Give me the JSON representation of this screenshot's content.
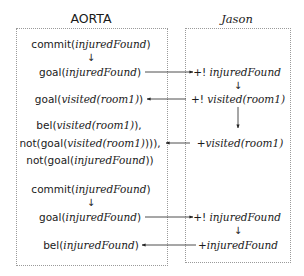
{
  "columns": {
    "left": {
      "title": "AORTA"
    },
    "right": {
      "title": "Jason"
    }
  },
  "left_items": [
    {
      "id": "l1",
      "prefix": "commit(",
      "arg": "injuredFound",
      "suffix": ")"
    },
    {
      "id": "l2",
      "prefix": "goal(",
      "arg": "injuredFound",
      "suffix": ")"
    },
    {
      "id": "l3",
      "prefix": "goal(",
      "arg": "visited(room1)",
      "suffix": ")"
    },
    {
      "id": "l4a",
      "prefix": "bel(",
      "arg": "visited(room1)",
      "suffix": "),",
      "continuation": true
    },
    {
      "id": "l4b",
      "prefix": "not(goal(",
      "arg": "visited(room1)",
      "suffix": "))),",
      "continuation": true
    },
    {
      "id": "l4c",
      "prefix": "not(goal(",
      "arg": "injuredFound",
      "suffix": "))"
    },
    {
      "id": "l5",
      "prefix": "commit(",
      "arg": "injuredFound",
      "suffix": ")"
    },
    {
      "id": "l6",
      "prefix": "goal(",
      "arg": "injuredFound",
      "suffix": ")"
    },
    {
      "id": "l7",
      "prefix": "bel(",
      "arg": "injuredFound",
      "suffix": ")"
    }
  ],
  "right_items": [
    {
      "id": "r1",
      "prefix": "+!",
      "arg": "injuredFound"
    },
    {
      "id": "r2",
      "prefix": "+!",
      "arg": "visited(room1)"
    },
    {
      "id": "r3",
      "prefix": "+",
      "arg": "visited(room1)"
    },
    {
      "id": "r4",
      "prefix": "+!",
      "arg": "injuredFound"
    },
    {
      "id": "r5",
      "prefix": "+",
      "arg": "injuredFound"
    }
  ],
  "down_arrow_glyph": "↓",
  "edges": [
    {
      "from": "l1",
      "to": "l2",
      "direction": "down"
    },
    {
      "from": "l2",
      "to": "r1",
      "direction": "right"
    },
    {
      "from": "r1",
      "to": "r2",
      "direction": "down"
    },
    {
      "from": "r2",
      "to": "l3",
      "direction": "left"
    },
    {
      "from": "r2",
      "to": "r3",
      "direction": "down"
    },
    {
      "from": "r3",
      "to": "l4b",
      "direction": "left"
    },
    {
      "from": "l5",
      "to": "l6",
      "direction": "down"
    },
    {
      "from": "l6",
      "to": "r4",
      "direction": "right"
    },
    {
      "from": "r4",
      "to": "r5",
      "direction": "down"
    },
    {
      "from": "r5",
      "to": "l7",
      "direction": "left"
    }
  ]
}
